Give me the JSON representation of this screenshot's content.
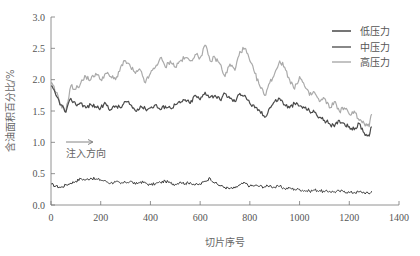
{
  "chart_data": {
    "type": "line",
    "title": "",
    "xlabel": "切片序号",
    "ylabel": "含油面积百分比/%",
    "xlim": [
      0,
      1400
    ],
    "ylim": [
      0,
      3.0
    ],
    "xticks": [
      0,
      200,
      400,
      600,
      800,
      1000,
      1200,
      1400
    ],
    "yticks": [
      0.0,
      0.5,
      1.0,
      1.5,
      2.0,
      2.5,
      3.0
    ],
    "xtick_labels": [
      "0",
      "200",
      "400",
      "600",
      "800",
      "1000",
      "1200",
      "1400"
    ],
    "ytick_labels": [
      "0.0",
      "0.5",
      "1.0",
      "1.5",
      "2.0",
      "2.5",
      "3.0"
    ],
    "grid": false,
    "legend_position": "upper right",
    "annotation": {
      "text": "注入方向",
      "arrow": "right",
      "x_start": 60,
      "x_end": 170,
      "y": 1.0
    },
    "x": [
      0,
      20,
      40,
      60,
      80,
      100,
      120,
      140,
      160,
      180,
      200,
      220,
      240,
      260,
      280,
      300,
      320,
      340,
      360,
      380,
      400,
      420,
      440,
      460,
      480,
      500,
      520,
      540,
      560,
      580,
      600,
      620,
      640,
      660,
      680,
      700,
      720,
      740,
      760,
      780,
      800,
      820,
      840,
      860,
      880,
      900,
      920,
      940,
      960,
      980,
      1000,
      1020,
      1040,
      1060,
      1080,
      1100,
      1120,
      1140,
      1160,
      1180,
      1200,
      1220,
      1240,
      1260,
      1280,
      1290
    ],
    "series": [
      {
        "name": "低压力",
        "color": "#3a3a3a",
        "values": [
          0.33,
          0.3,
          0.28,
          0.32,
          0.35,
          0.38,
          0.42,
          0.4,
          0.43,
          0.41,
          0.4,
          0.38,
          0.35,
          0.37,
          0.34,
          0.36,
          0.38,
          0.33,
          0.37,
          0.35,
          0.32,
          0.34,
          0.36,
          0.38,
          0.35,
          0.33,
          0.37,
          0.34,
          0.36,
          0.32,
          0.33,
          0.38,
          0.43,
          0.35,
          0.31,
          0.28,
          0.26,
          0.27,
          0.32,
          0.35,
          0.3,
          0.31,
          0.3,
          0.29,
          0.31,
          0.28,
          0.3,
          0.26,
          0.27,
          0.25,
          0.25,
          0.23,
          0.22,
          0.24,
          0.23,
          0.21,
          0.22,
          0.21,
          0.22,
          0.22,
          0.2,
          0.2,
          0.21,
          0.2,
          0.18,
          0.22
        ]
      },
      {
        "name": "中压力",
        "color": "#4a4a4a",
        "values": [
          1.9,
          1.75,
          1.6,
          1.48,
          1.7,
          1.6,
          1.63,
          1.55,
          1.6,
          1.57,
          1.55,
          1.62,
          1.52,
          1.58,
          1.55,
          1.65,
          1.6,
          1.5,
          1.58,
          1.53,
          1.55,
          1.6,
          1.52,
          1.58,
          1.55,
          1.6,
          1.63,
          1.68,
          1.62,
          1.75,
          1.68,
          1.8,
          1.72,
          1.75,
          1.68,
          1.78,
          1.7,
          1.65,
          1.78,
          1.75,
          1.62,
          1.55,
          1.5,
          1.4,
          1.55,
          1.65,
          1.7,
          1.6,
          1.55,
          1.62,
          1.58,
          1.55,
          1.5,
          1.48,
          1.4,
          1.35,
          1.3,
          1.25,
          1.35,
          1.3,
          1.25,
          1.2,
          1.3,
          1.15,
          1.1,
          1.25
        ]
      },
      {
        "name": "高压力",
        "color": "#aaaaaa",
        "values": [
          1.95,
          1.8,
          1.6,
          1.5,
          1.9,
          1.85,
          1.95,
          2.05,
          2.0,
          2.1,
          2.0,
          2.1,
          2.05,
          2.0,
          2.2,
          2.3,
          2.2,
          2.1,
          2.15,
          1.95,
          2.1,
          2.2,
          2.35,
          2.2,
          2.3,
          2.2,
          2.3,
          2.35,
          2.3,
          2.4,
          2.35,
          2.55,
          2.3,
          2.35,
          2.25,
          2.05,
          2.25,
          2.15,
          2.45,
          2.5,
          2.3,
          2.1,
          1.9,
          1.75,
          1.95,
          2.1,
          2.3,
          2.2,
          2.0,
          1.85,
          2.05,
          1.9,
          1.75,
          1.8,
          1.65,
          1.7,
          1.55,
          1.65,
          1.5,
          1.55,
          1.45,
          1.5,
          1.35,
          1.3,
          1.25,
          1.45
        ]
      }
    ]
  },
  "legend": {
    "items": [
      {
        "label": "低压力",
        "color": "#3a3a3a"
      },
      {
        "label": "中压力",
        "color": "#4a4a4a"
      },
      {
        "label": "高压力",
        "color": "#aaaaaa"
      }
    ]
  },
  "axes": {
    "x_title": "切片序号",
    "y_title": "含油面积百分比/%"
  },
  "annotation_text": "注入方向"
}
